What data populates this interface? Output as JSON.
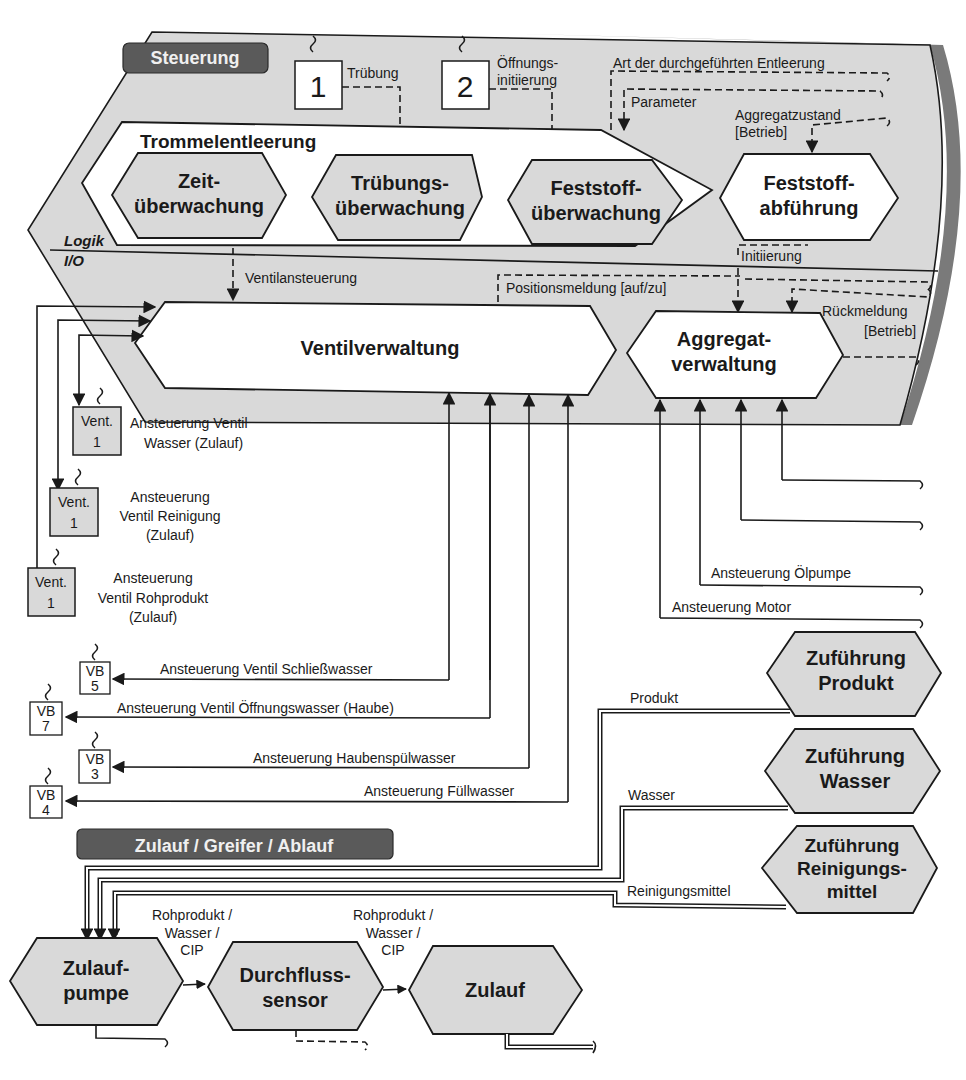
{
  "sections": {
    "steuerung": "Steuerung",
    "zulauf_greifer_ablauf": "Zulauf / Greifer / Ablauf"
  },
  "layers": {
    "logik": "Logik",
    "io": "I/O"
  },
  "sensors": [
    {
      "number": "1",
      "label": "Trübung"
    },
    {
      "number": "2",
      "label_line1": "Öffnungs-",
      "label_line2": "initiierung"
    }
  ],
  "signals_top": {
    "art_entleerung": "Art der durchgeführten Entleerung",
    "parameter": "Parameter",
    "aggregatzustand_1": "Aggregatzustand",
    "aggregatzustand_2": "[Betrieb]",
    "initiierung": "Initiierung",
    "ventilansteuerung": "Ventilansteuerung",
    "positionsmeldung": "Positionsmeldung [auf/zu]",
    "rueckmeldung_1": "Rückmeldung",
    "rueckmeldung_2": "[Betrieb]"
  },
  "trommelentleerung": {
    "title": "Trommelentleerung",
    "modules": [
      {
        "line1": "Zeit-",
        "line2": "überwachung"
      },
      {
        "line1": "Trübungs-",
        "line2": "überwachung"
      },
      {
        "line1": "Feststoff-",
        "line2": "überwachung"
      }
    ]
  },
  "feststoffabfuehrung": {
    "line1": "Feststoff-",
    "line2": "abführung"
  },
  "ventilverwaltung": "Ventilverwaltung",
  "aggregatverwaltung": {
    "line1": "Aggregat-",
    "line2": "verwaltung"
  },
  "valves_left": [
    {
      "box1": "Vent.",
      "box2": "1",
      "label1": "Ansteuerung Ventil",
      "label2": "Wasser (Zulauf)"
    },
    {
      "box1": "Vent.",
      "box2": "1",
      "label1": "Ansteuerung",
      "label2": "Ventil Reinigung",
      "label3": "(Zulauf)"
    },
    {
      "box1": "Vent.",
      "box2": "1",
      "label1": "Ansteuerung",
      "label2": "Ventil Rohprodukt",
      "label3": "(Zulauf)"
    }
  ],
  "valves_vb": [
    {
      "box1": "VB",
      "box2": "5",
      "label": "Ansteuerung Ventil Schließwasser"
    },
    {
      "box1": "VB",
      "box2": "7",
      "label": "Ansteuerung Ventil Öffnungswasser (Haube)"
    },
    {
      "box1": "VB",
      "box2": "3",
      "label": "Ansteuerung Haubenspülwasser"
    },
    {
      "box1": "VB",
      "box2": "4",
      "label": "Ansteuerung Füllwasser"
    }
  ],
  "aggregate_signals": {
    "oelpumpe": "Ansteuerung Ölpumpe",
    "motor": "Ansteuerung Motor"
  },
  "supplies": [
    {
      "line1": "Zuführung",
      "line2": "Produkt",
      "pipe_label": "Produkt"
    },
    {
      "line1": "Zuführung",
      "line2": "Wasser",
      "pipe_label": "Wasser"
    },
    {
      "line1": "Zuführung",
      "line2": "Reinigungs-",
      "line3": "mittel",
      "pipe_label": "Reinigungsmittel"
    }
  ],
  "process_chain": [
    {
      "line1": "Zulauf-",
      "line2": "pumpe"
    },
    {
      "line1": "Durchfluss-",
      "line2": "sensor"
    },
    {
      "line1": "Zulauf"
    }
  ],
  "flow_labels": [
    {
      "line1": "Rohprodukt /",
      "line2": "Wasser /",
      "line3": "CIP"
    },
    {
      "line1": "Rohprodukt /",
      "line2": "Wasser /",
      "line3": "CIP"
    }
  ],
  "colors": {
    "section_header": "#5a5a5a",
    "panel_fill": "#d9d9d9",
    "panel_edge": "#7a7a7a",
    "module_fill": "#d9d9d9",
    "line": "#1a1a1a"
  }
}
